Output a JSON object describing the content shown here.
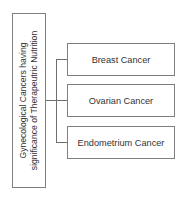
{
  "diagram": {
    "type": "tree-bracket",
    "root": {
      "label_line1": "Gynecological Cancers having",
      "label_line2": "significance of Therapeutric Nutrition"
    },
    "children": [
      {
        "label": "Breast Cancer"
      },
      {
        "label": "Ovarian Cancer"
      },
      {
        "label": "Endometrium Cancer"
      }
    ],
    "colors": {
      "border": "#7f7f7f",
      "connector": "#6f6f6f",
      "text": "#333333",
      "background": "#ffffff"
    }
  }
}
